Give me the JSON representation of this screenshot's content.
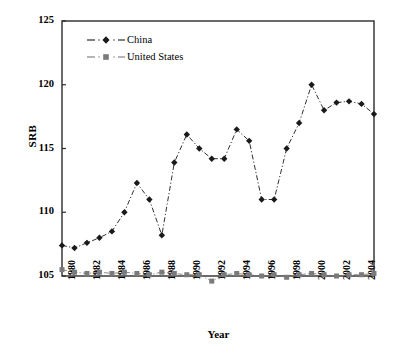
{
  "chart_data": {
    "type": "line",
    "title": "",
    "xlabel": "Year",
    "ylabel": "SRB",
    "ylim": [
      105,
      125
    ],
    "ytick_values": [
      105,
      110,
      115,
      120,
      125
    ],
    "xlim": [
      1980,
      2005
    ],
    "xtick_labels": [
      "1980",
      "1982",
      "1984",
      "1986",
      "1988",
      "1990",
      "1992",
      "1994",
      "1996",
      "1998",
      "2000",
      "2002",
      "2004"
    ],
    "xtick_values": [
      1980,
      1982,
      1984,
      1986,
      1988,
      1990,
      1992,
      1994,
      1996,
      1998,
      2000,
      2002,
      2004
    ],
    "grid": false,
    "legend_position": "upper-left-inside",
    "x": [
      1980,
      1981,
      1982,
      1983,
      1984,
      1985,
      1986,
      1987,
      1988,
      1989,
      1990,
      1991,
      1992,
      1993,
      1994,
      1995,
      1996,
      1997,
      1998,
      1999,
      2000,
      2001,
      2002,
      2003,
      2004,
      2005
    ],
    "series": [
      {
        "name": "China",
        "marker": "diamond",
        "linestyle": "dash-dot",
        "color": "#1a1a1a",
        "values": [
          107.4,
          107.2,
          107.6,
          108.0,
          108.5,
          110.0,
          112.3,
          111.0,
          108.2,
          113.9,
          116.1,
          115.0,
          114.2,
          114.2,
          116.5,
          115.6,
          111.0,
          111.0,
          115.0,
          117.0,
          120.0,
          118.0,
          118.6,
          118.7,
          118.5,
          117.7
        ]
      },
      {
        "name": "United States",
        "marker": "square",
        "linestyle": "dash-dot",
        "color": "#7a7a7a",
        "values": [
          105.5,
          105.3,
          105.2,
          105.3,
          105.2,
          105.3,
          105.2,
          105.1,
          105.3,
          105.2,
          105.1,
          105.1,
          104.6,
          105.1,
          105.2,
          105.1,
          105.0,
          105.1,
          104.9,
          105.1,
          105.2,
          105.1,
          105.0,
          105.1,
          105.1,
          105.2
        ]
      }
    ]
  }
}
